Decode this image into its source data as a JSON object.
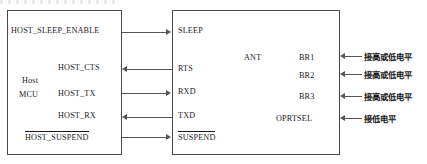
{
  "diagram": {
    "host_block": {
      "name_line1": "Host",
      "name_line2": "MCU"
    },
    "left_signals": [
      {
        "label": "HOST_SLEEP_ENABLE",
        "overline": false,
        "direction": "out"
      },
      {
        "label": "HOST_CTS",
        "overline": false,
        "direction": "in"
      },
      {
        "label": "HOST_TX",
        "overline": false,
        "direction": "out"
      },
      {
        "label": "HOST_RX",
        "overline": false,
        "direction": "in"
      },
      {
        "label": "HOST_SUSPEND",
        "overline": true,
        "direction": "out"
      }
    ],
    "right_signals": [
      {
        "label": "SLEEP",
        "overline": false
      },
      {
        "label": "RTS",
        "overline": false
      },
      {
        "label": "RXD",
        "overline": false
      },
      {
        "label": "TXD",
        "overline": false
      },
      {
        "label": "SUSPEND",
        "overline": true
      }
    ],
    "module_pins": {
      "ant": "ANT",
      "config": [
        "BR1",
        "BR2",
        "BR3",
        "OPRTSEL"
      ]
    },
    "annotations": [
      "接高或低电平",
      "接高或低电平",
      "接高或低电平",
      "接低电平"
    ],
    "colors": {
      "stroke": "#4a4a4a",
      "wire": "#555555",
      "text": "#1b1b1b",
      "background": "#ffffff"
    }
  }
}
